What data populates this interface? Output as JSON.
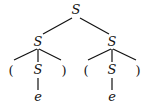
{
  "diagram": {
    "type": "parse-tree",
    "nodes": [
      {
        "id": "root",
        "label": "S",
        "x": 76,
        "y": 14
      },
      {
        "id": "s1",
        "label": "S",
        "x": 38,
        "y": 46
      },
      {
        "id": "s2",
        "label": "S",
        "x": 112,
        "y": 46
      },
      {
        "id": "lp1",
        "label": "(",
        "x": 11,
        "y": 74
      },
      {
        "id": "s1c",
        "label": "S",
        "x": 38,
        "y": 74
      },
      {
        "id": "rp1",
        "label": ")",
        "x": 64,
        "y": 74
      },
      {
        "id": "lp2",
        "label": "(",
        "x": 86,
        "y": 74
      },
      {
        "id": "s2c",
        "label": "S",
        "x": 112,
        "y": 74
      },
      {
        "id": "rp2",
        "label": ")",
        "x": 138,
        "y": 74
      },
      {
        "id": "e1",
        "label": "e",
        "x": 38,
        "y": 102
      },
      {
        "id": "e2",
        "label": "e",
        "x": 112,
        "y": 102
      }
    ]
  }
}
